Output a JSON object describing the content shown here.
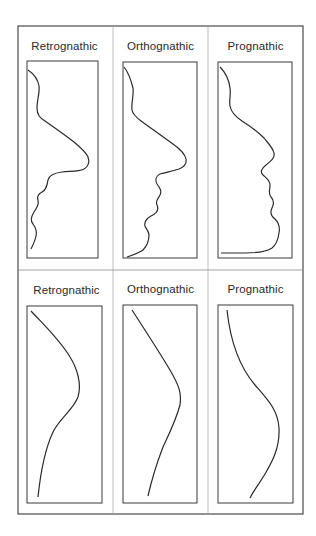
{
  "figure": {
    "rows": [
      {
        "type": "soft-tissue-profile",
        "panels": [
          {
            "label": "Retrognathic"
          },
          {
            "label": "Orthognathic"
          },
          {
            "label": "Prognathic"
          }
        ]
      },
      {
        "type": "simplified-profile-curve",
        "panels": [
          {
            "label": "Retrognathic"
          },
          {
            "label": "Orthognathic"
          },
          {
            "label": "Prognathic"
          }
        ]
      }
    ],
    "colors": {
      "line": "#2b2b2b",
      "frame": "#3a3a3a",
      "divider": "#9a9a9a",
      "background": "#ffffff"
    }
  }
}
